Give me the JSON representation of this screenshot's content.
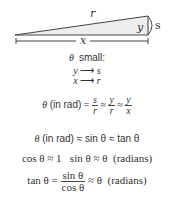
{
  "diagram": {
    "labels": {
      "r": "r",
      "y": "y",
      "s": "s",
      "x": "x"
    },
    "colors": {
      "triangle_fill": "#eeeeee",
      "stroke": "#444444",
      "text": "#333333"
    }
  },
  "caption": {
    "theta": "θ",
    "small": "small:"
  },
  "limits": [
    {
      "from": "y",
      "arrow": "⟶",
      "to": "s"
    },
    {
      "from": "x",
      "arrow": "⟶",
      "to": "r"
    }
  ],
  "eq1": {
    "theta": "θ",
    "unit": "(in rad)",
    "eq": "=",
    "f1_num": "s",
    "f1_den": "r",
    "approx1": "≈",
    "f2_num": "y",
    "f2_den": "r",
    "approx2": "≈",
    "f3_num": "y",
    "f3_den": "x"
  },
  "eq2": {
    "text_a": "θ",
    "text_b": "(in rad)",
    "approx1": "≈",
    "sin": "sin θ",
    "approx2": "≈",
    "tan": "tan θ"
  },
  "eq3": {
    "cos": "cos θ ≈ 1",
    "sin": "sin θ ≈ θ",
    "unit": "(radians)"
  },
  "eq4": {
    "lhs": "tan θ",
    "eq": "=",
    "num": "sin θ",
    "den": "cos θ",
    "approx": "≈ θ",
    "unit": "(radians)"
  }
}
